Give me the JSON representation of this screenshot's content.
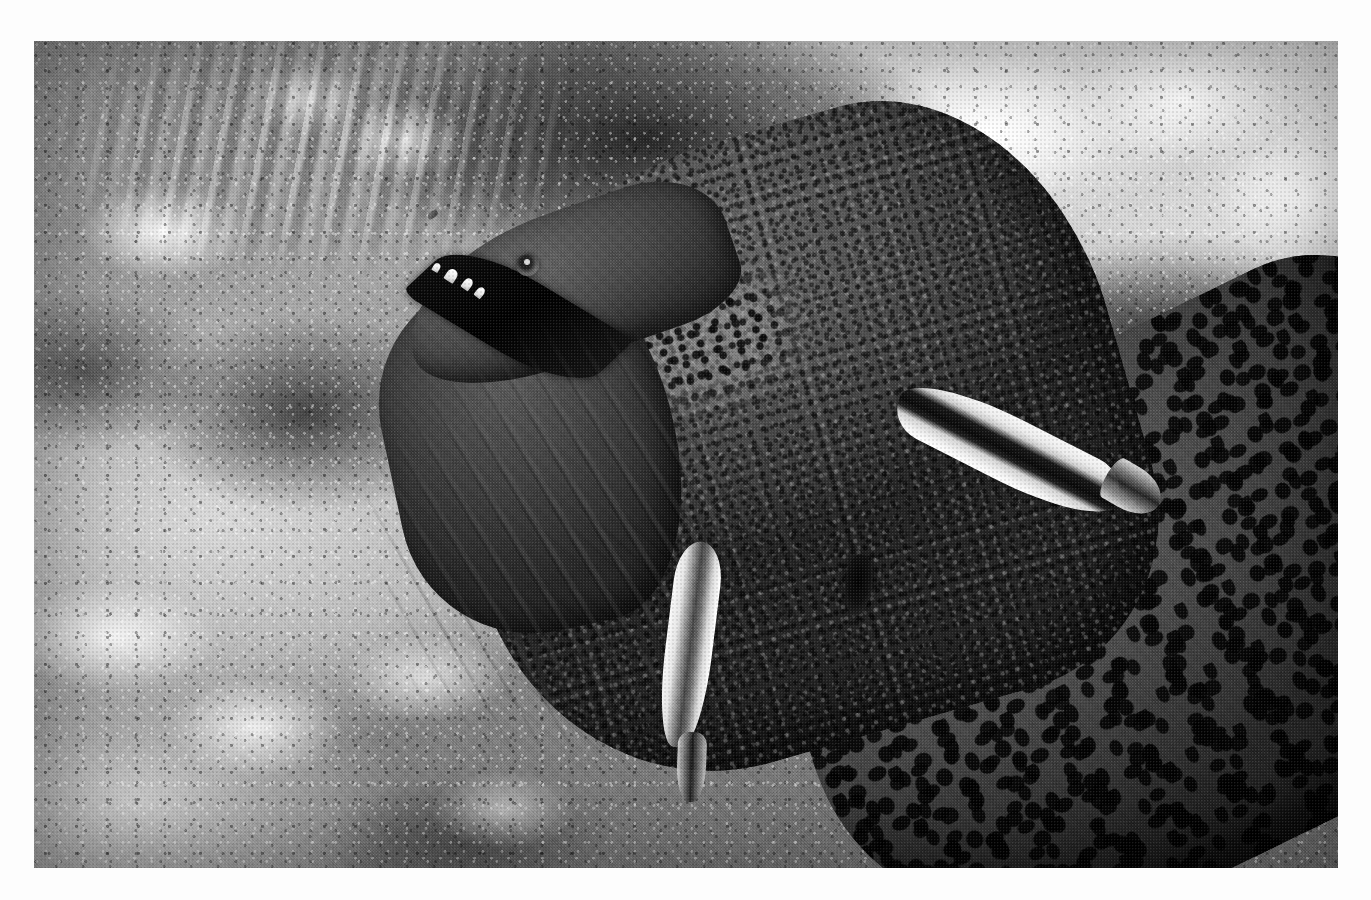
{
  "page": {
    "background_color": "#ffffff",
    "width": 1371,
    "height": 900
  },
  "photo": {
    "name": "giant-moray-eel-with-cleaner-wrasse",
    "description": "Black and white underwater photograph of a giant moray eel emerging from a coral reef crevice with two cleaner wrasse attending it",
    "rendering": "black-and-white",
    "frame": {
      "left": 34,
      "top": 41,
      "width": 1304,
      "height": 827
    },
    "caption": "",
    "tones": {
      "highlight": "#ffffff",
      "light_coral": "#e8e8e5",
      "midtone": "#8d8b87",
      "eel_skin": "#55554f",
      "shadow": "#2a2a28",
      "deep_shadow": "#0a0a0a"
    }
  },
  "subjects": {
    "eel": {
      "label": "giant-moray-eel",
      "pose": "head raised, mouth open, body angled down-right",
      "parts": {
        "snout": "upper jaw wedge pointing up-left",
        "nostril": "short tubular nostril at snout tip",
        "jaw": "lower jaw angled down-left",
        "gape": "dark open mouth between jaws",
        "teeth": "four white conical teeth along upper jaw",
        "eye": "small round eye with pale iris ring and dark pupil",
        "cheek": "dense dark speckled patch behind the eye",
        "gill": "dark oval gill opening on the flank",
        "folds": "wrinkled skin folds across throat and neck",
        "trunk": "leopard-mottled body filling the lower right"
      }
    },
    "fish": [
      {
        "label": "cleaner-wrasse-upper",
        "position": "on the eel's flank, upper right",
        "markings": "pale body with a bold dark horizontal mid-stripe"
      },
      {
        "label": "cleaner-wrasse-lower",
        "position": "vertical, against the eel's throat",
        "markings": "pale body with a darker central band"
      }
    ],
    "reef": {
      "label": "coral-reef-background",
      "features": [
        "branching finger coral, upper left",
        "bright encrusted coral rock, upper right",
        "dark crevice shadow behind the eel",
        "smooth pale sand / hazy patch, middle left",
        "coral rubble, lower left",
        "bright white coral nodules, right edge"
      ]
    }
  }
}
